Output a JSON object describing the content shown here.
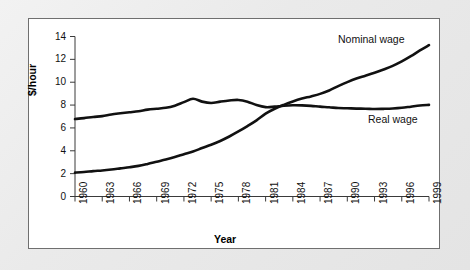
{
  "chart_data": {
    "type": "line",
    "title": "",
    "subtitle": "",
    "xlabel": "Year",
    "ylabel": "$/hour",
    "grid": false,
    "legend_position": "inline-annotations",
    "xlim": [
      1960,
      1999
    ],
    "ylim": [
      0,
      14
    ],
    "yticks": [
      0,
      2,
      4,
      6,
      8,
      10,
      12,
      14
    ],
    "ytick_labels": [
      "0",
      "2",
      "4",
      "6",
      "8",
      "10",
      "12",
      "14"
    ],
    "xticks": [
      1960,
      1963,
      1966,
      1969,
      1972,
      1975,
      1978,
      1981,
      1984,
      1987,
      1990,
      1993,
      1996,
      1999
    ],
    "xtick_labels": [
      "1960",
      "1963",
      "1966",
      "1969",
      "1972",
      "1975",
      "1978",
      "1981",
      "1984",
      "1987",
      "1990",
      "1993",
      "1996",
      "1999"
    ],
    "x": [
      1960,
      1961,
      1962,
      1963,
      1964,
      1965,
      1966,
      1967,
      1968,
      1969,
      1970,
      1971,
      1972,
      1973,
      1974,
      1975,
      1976,
      1977,
      1978,
      1979,
      1980,
      1981,
      1982,
      1983,
      1984,
      1985,
      1986,
      1987,
      1988,
      1989,
      1990,
      1991,
      1992,
      1993,
      1994,
      1995,
      1996,
      1997,
      1998,
      1999
    ],
    "series": [
      {
        "name": "Nominal wage",
        "color": "#111111",
        "values": [
          2.09,
          2.14,
          2.22,
          2.28,
          2.36,
          2.46,
          2.56,
          2.68,
          2.85,
          3.04,
          3.23,
          3.45,
          3.7,
          3.94,
          4.24,
          4.53,
          4.86,
          5.25,
          5.69,
          6.16,
          6.66,
          7.25,
          7.68,
          8.02,
          8.32,
          8.57,
          8.76,
          8.98,
          9.28,
          9.66,
          10.01,
          10.32,
          10.57,
          10.83,
          11.12,
          11.43,
          11.82,
          12.28,
          12.78,
          13.24
        ]
      },
      {
        "name": "Real wage",
        "color": "#111111",
        "values": [
          6.78,
          6.86,
          6.96,
          7.03,
          7.18,
          7.28,
          7.37,
          7.46,
          7.6,
          7.68,
          7.76,
          7.95,
          8.26,
          8.55,
          8.3,
          8.18,
          8.3,
          8.4,
          8.45,
          8.3,
          8.0,
          7.82,
          7.86,
          7.94,
          7.98,
          7.97,
          7.93,
          7.86,
          7.81,
          7.74,
          7.72,
          7.69,
          7.68,
          7.65,
          7.67,
          7.7,
          7.76,
          7.86,
          7.96,
          8.02
        ]
      }
    ],
    "annotations": [
      {
        "text": "Nominal wage",
        "x": 1993,
        "y": 13.6
      },
      {
        "text": "Real wage",
        "x": 1996,
        "y": 6.6
      }
    ]
  },
  "style": {
    "page_background": "#eaeaea",
    "plot_background": "#ffffff",
    "frame_border": "#6f6f6f",
    "axis_color": "#3a3a3a",
    "line_color": "#111111"
  }
}
